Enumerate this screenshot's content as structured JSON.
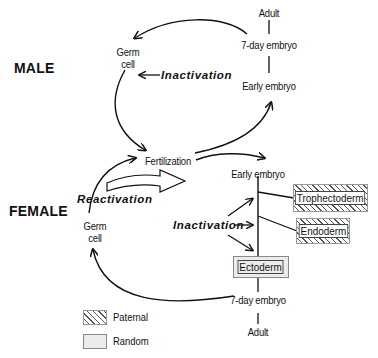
{
  "male": {
    "title": "MALE",
    "germ_cell": "Germ\ncell",
    "inactivation": "Inactivation",
    "adult": "Adult",
    "seven_day_embryo": "7-day embryo",
    "early_embryo": "Early embryo"
  },
  "female": {
    "title": "FEMALE",
    "germ_cell": "Germ\ncell",
    "reactivation": "Reactivation",
    "inactivation": "Inactivation",
    "early_embryo": "Early embryo",
    "seven_day_embryo": "7-day embryo",
    "adult": "Adult",
    "lineages": [
      {
        "label": "Trophectoderm",
        "pattern": "Paternal"
      },
      {
        "label": "Endoderm",
        "pattern": "Paternal"
      },
      {
        "label": "Ectoderm",
        "pattern": "Random"
      }
    ]
  },
  "fertilization": "Fertilization",
  "legend": [
    {
      "label": "Paternal",
      "pattern": "hatch"
    },
    {
      "label": "Random",
      "pattern": "gray"
    }
  ]
}
